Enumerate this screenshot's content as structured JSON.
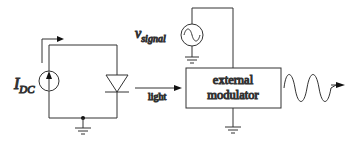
{
  "diagram": {
    "labels": {
      "current_source": "I",
      "current_source_sub": "DC",
      "signal_source": "v",
      "signal_source_sub": "signal",
      "light": "light",
      "modulator_line1": "external",
      "modulator_line2": "modulator"
    },
    "components": [
      {
        "id": "dc-current-source",
        "type": "current-source",
        "label": "I_DC"
      },
      {
        "id": "laser-diode",
        "type": "diode"
      },
      {
        "id": "ground-1",
        "type": "ground"
      },
      {
        "id": "signal-source",
        "type": "ac-voltage-source",
        "label": "v_signal"
      },
      {
        "id": "ground-2",
        "type": "ground"
      },
      {
        "id": "external-modulator",
        "type": "block",
        "label": "external modulator"
      },
      {
        "id": "ground-3",
        "type": "ground"
      },
      {
        "id": "modulated-output",
        "type": "sine-wave-arrow"
      }
    ],
    "colors": {
      "line": "#333333",
      "background": "#ffffff"
    }
  }
}
